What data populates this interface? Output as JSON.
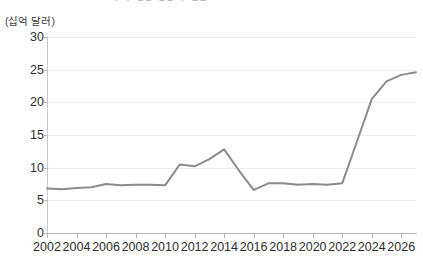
{
  "header": {
    "cutoff_text": "· · –– ––   ·  ––"
  },
  "chart_data": {
    "type": "line",
    "title": "",
    "subtitle": "",
    "unit_label": "(십억 달러)",
    "xlabel": "",
    "ylabel": "",
    "xlim": [
      2002,
      2027
    ],
    "ylim": [
      0,
      30
    ],
    "grid": true,
    "legend": "none",
    "line_color": "#8c8c8c",
    "axis_color": "#b5b5b5",
    "grid_color": "#ececec",
    "text_color": "#2e2e2e",
    "y_ticks": [
      0,
      5,
      10,
      15,
      20,
      25,
      30
    ],
    "y_tick_labels": [
      "0",
      "5",
      "10",
      "15",
      "20",
      "25",
      "30"
    ],
    "x_ticks": [
      2002,
      2004,
      2006,
      2008,
      2010,
      2012,
      2014,
      2016,
      2018,
      2020,
      2022,
      2024,
      2026
    ],
    "x_tick_labels": [
      "2002",
      "2004",
      "2006",
      "2008",
      "2010",
      "2012",
      "2014",
      "2016",
      "2018",
      "2020",
      "2022",
      "2024",
      "2026"
    ],
    "x": [
      2002,
      2003,
      2004,
      2005,
      2006,
      2007,
      2008,
      2009,
      2010,
      2011,
      2012,
      2013,
      2014,
      2015,
      2016,
      2017,
      2018,
      2019,
      2020,
      2021,
      2022,
      2023,
      2024,
      2025,
      2026,
      2027
    ],
    "values": [
      6.8,
      6.7,
      6.9,
      7.0,
      7.5,
      7.3,
      7.4,
      7.4,
      7.3,
      10.5,
      10.2,
      11.3,
      12.8,
      9.6,
      6.6,
      7.6,
      7.6,
      7.4,
      7.5,
      7.4,
      7.6,
      14.0,
      20.5,
      23.2,
      24.2,
      24.6
    ]
  }
}
